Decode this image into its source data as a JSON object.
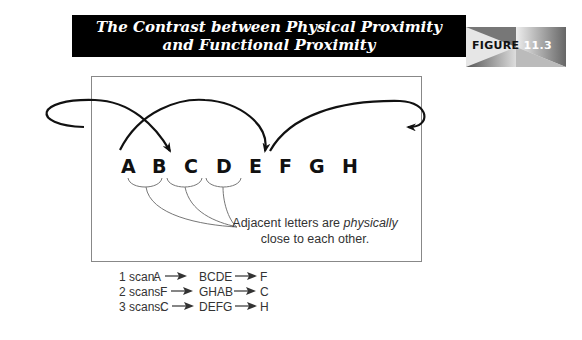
{
  "header": {
    "title_line1": "The Contrast between Physical Proximity",
    "title_line2": "and Functional Proximity",
    "figure_label": "FIGURE",
    "figure_number": "11.3"
  },
  "diagram": {
    "letters": [
      "A",
      "B",
      "C",
      "D",
      "E",
      "F",
      "G",
      "H"
    ],
    "caption_pre": "Adjacent letters are ",
    "caption_em": "physically",
    "caption_post": "close to each other.",
    "colors": {
      "arc": "#111111",
      "bracket": "#777777",
      "box": "#888888"
    }
  },
  "scans": [
    {
      "label": "1 scan:",
      "from": "A",
      "middle": "BCDE",
      "to": "F"
    },
    {
      "label": "2 scans:",
      "from": "F",
      "middle": "GHAB",
      "to": "C"
    },
    {
      "label": "3 scans:",
      "from": "C",
      "middle": "DEFG",
      "to": "H"
    }
  ]
}
